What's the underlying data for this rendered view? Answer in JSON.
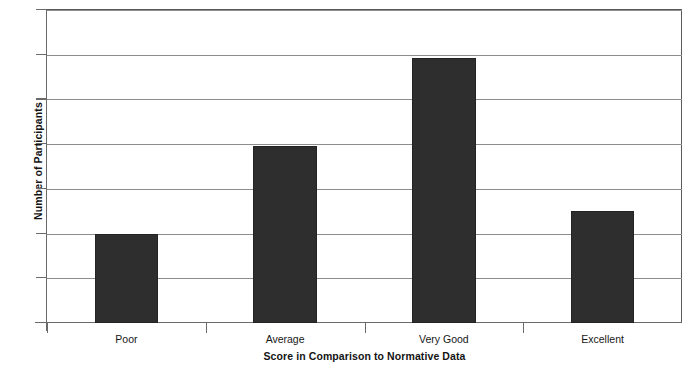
{
  "chart_data": {
    "type": "bar",
    "title": "",
    "categories": [
      "Poor",
      "Average",
      "Very Good",
      "Excellent"
    ],
    "values": [
      4.0,
      7.9,
      11.85,
      5.0
    ],
    "xlabel": "Score in Comparison to Normative Data",
    "ylabel": "Number of Participants",
    "ylim": [
      0,
      14
    ],
    "yticks": [
      0,
      2,
      4,
      6,
      8,
      10,
      12,
      14
    ],
    "ytick_labels": [
      "0",
      "2",
      "4",
      "6",
      "8",
      "10",
      "12",
      "14"
    ],
    "grid": "horizontal",
    "legend": "none",
    "bar_color": "#2e2e2e",
    "gridline_color": "#8d8d8d",
    "axis_color": "#6a6a6a",
    "background": "#ffffff"
  }
}
